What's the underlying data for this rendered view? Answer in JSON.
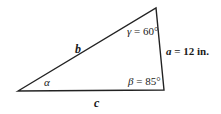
{
  "diagram": {
    "type": "triangle",
    "vertices": {
      "left": [
        18,
        91
      ],
      "top": [
        156,
        8
      ],
      "bottom_right": [
        164,
        90
      ]
    },
    "stroke_color": "#222222",
    "sides": {
      "b": "b",
      "c": "c",
      "a": "a = 12 in."
    },
    "angles": {
      "alpha": "α",
      "beta": "β = 85°",
      "gamma": "γ = 60°"
    }
  }
}
